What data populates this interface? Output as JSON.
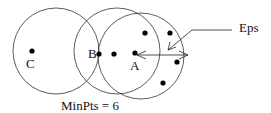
{
  "labels": {
    "c": "C",
    "b": "B",
    "a": "A",
    "eps": "Eps",
    "minpts": "MinPts = 6"
  },
  "circles": [
    {
      "name": "neighborhood-c",
      "cx": 56,
      "cy": 51,
      "r": 43
    },
    {
      "name": "neighborhood-b",
      "cx": 117,
      "cy": 51,
      "r": 43
    },
    {
      "name": "neighborhood-a",
      "cx": 141,
      "cy": 56,
      "r": 43
    }
  ],
  "points": [
    {
      "x": 32,
      "y": 51
    },
    {
      "x": 99,
      "y": 54
    },
    {
      "x": 114,
      "y": 54
    },
    {
      "x": 135,
      "y": 53
    },
    {
      "x": 145,
      "y": 33
    },
    {
      "x": 170,
      "y": 33
    },
    {
      "x": 177,
      "y": 62
    },
    {
      "x": 163,
      "y": 83
    }
  ]
}
